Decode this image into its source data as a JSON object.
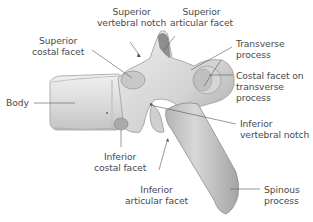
{
  "diagram": {
    "colors": {
      "background": "#ffffff",
      "bone_light": "#e6e6e6",
      "bone_mid": "#c9c9c9",
      "bone_dark": "#9a9a9a",
      "label_text": "#4a4a4a",
      "leader_line": "#555555"
    },
    "labels": {
      "superior_vertebral_notch": [
        "Superior",
        "vertebral notch"
      ],
      "superior_articular_facet": [
        "Superior",
        "articular facet"
      ],
      "superior_costal_facet": [
        "Superior",
        "costal facet"
      ],
      "transverse_process": [
        "Transverse",
        "process"
      ],
      "costal_facet_on_transverse_process": [
        "Costal facet on",
        "transverse",
        "process"
      ],
      "body": [
        "Body"
      ],
      "inferior_vertebral_notch": [
        "Inferior",
        "vertebral notch"
      ],
      "inferior_costal_facet": [
        "Inferior",
        "costal facet"
      ],
      "inferior_articular_facet": [
        "Inferior",
        "articular facet"
      ],
      "spinous_process": [
        "Spinous",
        "process"
      ]
    }
  }
}
